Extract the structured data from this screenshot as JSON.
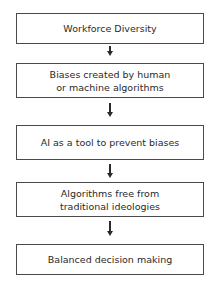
{
  "flowchart": {
    "steps": [
      {
        "label": "Workforce Diversity"
      },
      {
        "label": "Biases created by human or machine algorithms"
      },
      {
        "label": "AI as a tool to prevent biases"
      },
      {
        "label": "Algorithms free from traditional ideologies"
      },
      {
        "label": "Balanced decision making"
      }
    ],
    "arrow_icon": "down-arrow-icon",
    "colors": {
      "border": "#4a4a4a",
      "text": "#2a2a2a",
      "background": "#ffffff"
    }
  }
}
